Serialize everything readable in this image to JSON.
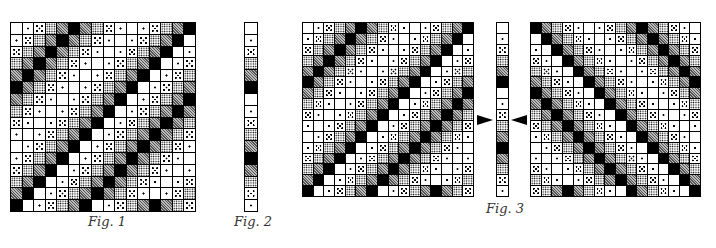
{
  "figures": {
    "fig1": {
      "label": "Fig. 1",
      "rows": 16,
      "cols": 16,
      "shade_legend": [
        "white",
        "single-dot",
        "five-dot",
        "dense-dots",
        "gray-screen",
        "black"
      ],
      "matrix": [
        [
          0,
          1,
          2,
          3,
          4,
          5,
          4,
          3,
          2,
          1,
          0,
          1,
          2,
          3,
          4,
          5
        ],
        [
          1,
          2,
          3,
          4,
          5,
          4,
          3,
          2,
          1,
          0,
          1,
          2,
          3,
          4,
          5,
          0
        ],
        [
          2,
          3,
          4,
          5,
          4,
          3,
          2,
          1,
          0,
          1,
          2,
          3,
          4,
          5,
          0,
          1
        ],
        [
          3,
          4,
          5,
          4,
          3,
          2,
          1,
          0,
          1,
          2,
          3,
          4,
          5,
          0,
          1,
          2
        ],
        [
          4,
          5,
          4,
          3,
          2,
          1,
          0,
          1,
          2,
          3,
          4,
          5,
          0,
          1,
          2,
          3
        ],
        [
          5,
          4,
          3,
          2,
          1,
          0,
          1,
          2,
          3,
          4,
          5,
          0,
          1,
          2,
          3,
          4
        ],
        [
          4,
          3,
          2,
          1,
          0,
          1,
          2,
          3,
          4,
          5,
          0,
          1,
          2,
          3,
          4,
          5
        ],
        [
          3,
          2,
          1,
          0,
          1,
          2,
          3,
          4,
          5,
          0,
          1,
          2,
          3,
          4,
          5,
          4
        ],
        [
          2,
          1,
          0,
          1,
          2,
          3,
          4,
          5,
          0,
          1,
          2,
          3,
          4,
          5,
          4,
          3
        ],
        [
          1,
          0,
          1,
          2,
          3,
          4,
          5,
          0,
          1,
          2,
          3,
          4,
          5,
          4,
          3,
          2
        ],
        [
          0,
          1,
          2,
          3,
          4,
          5,
          0,
          1,
          2,
          3,
          4,
          5,
          4,
          3,
          2,
          1
        ],
        [
          1,
          2,
          3,
          4,
          5,
          0,
          1,
          2,
          3,
          4,
          5,
          4,
          3,
          2,
          1,
          0
        ],
        [
          2,
          3,
          4,
          5,
          0,
          1,
          2,
          3,
          4,
          5,
          4,
          3,
          2,
          1,
          0,
          1
        ],
        [
          3,
          4,
          5,
          0,
          1,
          2,
          3,
          4,
          5,
          4,
          3,
          2,
          1,
          0,
          1,
          2
        ],
        [
          4,
          5,
          0,
          1,
          2,
          3,
          4,
          5,
          4,
          3,
          2,
          1,
          0,
          1,
          2,
          3
        ],
        [
          5,
          0,
          1,
          2,
          3,
          4,
          5,
          0,
          1,
          2,
          3,
          4,
          5,
          4,
          3,
          2
        ]
      ]
    },
    "fig2": {
      "label": "Fig. 2",
      "column": [
        0,
        1,
        2,
        3,
        4,
        5,
        0,
        1,
        2,
        3,
        4,
        5,
        4,
        3,
        2,
        1
      ]
    },
    "fig3": {
      "label": "Fig. 3",
      "left_matrix_same_as": "fig1",
      "right_matrix_mirrored": true,
      "arrows": [
        "right-pointing",
        "left-pointing"
      ]
    }
  }
}
